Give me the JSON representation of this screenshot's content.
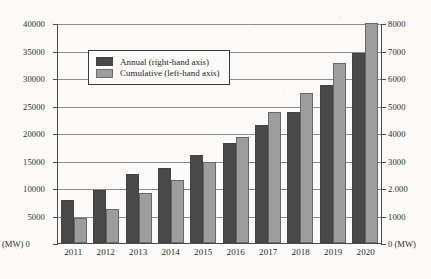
{
  "chart_data": {
    "type": "bar",
    "title": "",
    "subtitle": "",
    "xlabel": "",
    "ylabel": "(MW)",
    "y2label": "(MW)",
    "categories": [
      "2011",
      "2012",
      "2013",
      "2014",
      "2015",
      "2016",
      "2017",
      "2018",
      "2019",
      "2020"
    ],
    "series": [
      {
        "name": "Annual (right-hand axis)",
        "axis": "left",
        "color": "#494949",
        "values": [
          7900,
          9700,
          12500,
          13600,
          15950,
          18200,
          21400,
          23900,
          28800,
          34500
        ]
      },
      {
        "name": "Cumulative (left-hand axis)",
        "axis": "right",
        "color": "#9d9d9d",
        "values": [
          900,
          1230,
          1830,
          2280,
          2930,
          3850,
          4750,
          5450,
          6550,
          8000
        ]
      }
    ],
    "ylim": [
      0,
      40000
    ],
    "y2lim": [
      0,
      8000
    ],
    "yticks": [
      0,
      5000,
      10000,
      15000,
      20000,
      25000,
      30000,
      35000,
      40000
    ],
    "yticklabels": [
      "0",
      "5000",
      "10000",
      "15000",
      "20000",
      "25000",
      "30000",
      "35000",
      "40000"
    ],
    "y2ticks": [
      0,
      1000,
      2000,
      3000,
      4000,
      5000,
      6000,
      7000,
      8000
    ],
    "y2ticklabels": [
      "0",
      "1000",
      "2.000",
      "3000",
      "4000",
      "5000",
      "6000",
      "7000",
      "8000"
    ],
    "grid": true,
    "legend_position": "upper-left-inside"
  },
  "axes": {
    "left_unit": "(MW)",
    "left_zero": "0",
    "right_unit": "(MW)",
    "right_zero": "0"
  },
  "legend": {
    "items": [
      {
        "label": "Annual (right-hand axis)",
        "color": "#494949"
      },
      {
        "label": "Cumulative (left-hand axis)",
        "color": "#9d9d9d"
      }
    ]
  }
}
